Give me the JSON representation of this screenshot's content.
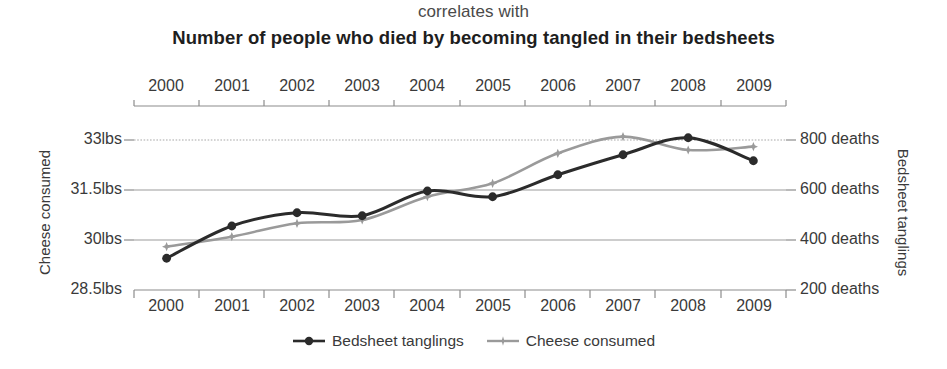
{
  "header": {
    "subtitle": "correlates with",
    "title": "Number of people who died by becoming tangled in their bedsheets"
  },
  "axes": {
    "left_title": "Cheese consumed",
    "right_title": "Bedsheet tanglings",
    "left_ticks": [
      "33lbs",
      "31.5lbs",
      "30lbs",
      "28.5lbs"
    ],
    "right_ticks": [
      "800 deaths",
      "600 deaths",
      "400 deaths",
      "200 deaths"
    ],
    "x_ticks": [
      "2000",
      "2001",
      "2002",
      "2003",
      "2004",
      "2005",
      "2006",
      "2007",
      "2008",
      "2009"
    ]
  },
  "legend": {
    "items": [
      {
        "label": "Bedsheet tanglings",
        "marker": "circle-marker",
        "color": "#2b2b2b"
      },
      {
        "label": "Cheese consumed",
        "marker": "star-marker",
        "color": "#9a9a9a"
      }
    ]
  },
  "colors": {
    "bedsheet": "#2b2b2b",
    "cheese": "#9a9a9a",
    "gridline": "#9b9b9b",
    "axis": "#8c8c8c",
    "text": "#3a3a3a",
    "title": "#1e1e1e",
    "background": "#ffffff"
  },
  "chart_data": {
    "type": "line",
    "title": "Number of people who died by becoming tangled in their bedsheets",
    "subtitle": "correlates with",
    "xlabel": "",
    "x": [
      2000,
      2001,
      2002,
      2003,
      2004,
      2005,
      2006,
      2007,
      2008,
      2009
    ],
    "grid": true,
    "legend_position": "bottom",
    "series": [
      {
        "name": "Bedsheet tanglings",
        "axis": "right",
        "ylabel": "Bedsheet tanglings",
        "unit": "deaths",
        "ylim": [
          200,
          900
        ],
        "yticks": [
          200,
          400,
          600,
          800
        ],
        "color": "#2b2b2b",
        "marker": "circle-marker",
        "values": [
          327,
          456,
          509,
          497,
          596,
          573,
          661,
          741,
          809,
          717
        ]
      },
      {
        "name": "Cheese consumed",
        "axis": "left",
        "ylabel": "Cheese consumed",
        "unit": "lbs",
        "ylim": [
          28.5,
          33.75
        ],
        "yticks": [
          28.5,
          30,
          31.5,
          33
        ],
        "color": "#9a9a9a",
        "marker": "star-marker",
        "values": [
          29.8,
          30.1,
          30.5,
          30.6,
          31.3,
          31.7,
          32.6,
          33.1,
          32.7,
          32.8
        ]
      }
    ]
  }
}
